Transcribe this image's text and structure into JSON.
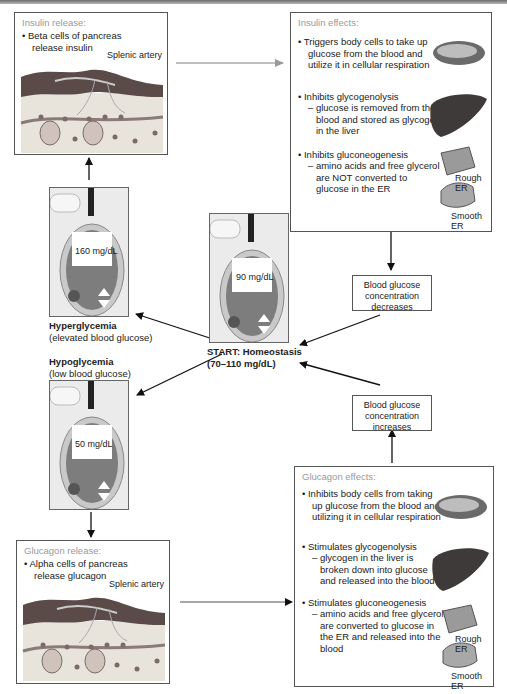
{
  "insulin_release": {
    "title": "Insulin release:",
    "bullet": "• Beta cells of pancreas",
    "bullet_cont": "release insulin",
    "artery_label": "Splenic artery"
  },
  "insulin_effects": {
    "title": "Insulin effects:",
    "items": [
      {
        "lines": [
          "• Triggers body cells to take up",
          "glucose from the blood and",
          "utilize it in cellular respiration"
        ]
      },
      {
        "lines": [
          "• Inhibits glycogenolysis",
          "– glucose is removed from the",
          "blood and stored as glycogen",
          "in the liver"
        ]
      },
      {
        "lines": [
          "• Inhibits gluconeogenesis",
          "– amino acids and free glycerol",
          "are NOT converted to",
          "glucose in the ER"
        ]
      }
    ],
    "rough_er": "Rough ER",
    "smooth_er": "Smooth ER"
  },
  "meters": {
    "high": "160 mg/dL",
    "normal": "90 mg/dL",
    "low": "50 mg/dL",
    "ok_label": "OK"
  },
  "states": {
    "hyper_title": "Hyperglycemia",
    "hyper_sub": "(elevated blood glucose)",
    "hypo_title": "Hypoglycemia",
    "hypo_sub": "(low blood glucose)",
    "start_title": "START: Homeostasis",
    "start_sub": "(70–110 mg/dL)"
  },
  "boxes": {
    "decreases": [
      "Blood glucose",
      "concentration",
      "decreases"
    ],
    "increases": [
      "Blood glucose",
      "concentration",
      "increases"
    ]
  },
  "glucagon_release": {
    "title": "Glucagon release:",
    "bullet": "• Alpha cells of pancreas",
    "bullet_cont": "release glucagon",
    "artery_label": "Splenic artery"
  },
  "glucagon_effects": {
    "title": "Glucagon effects:",
    "items": [
      {
        "lines": [
          "• Inhibits body cells from taking",
          "up glucose from the blood and",
          "utilizing it in cellular respiration"
        ]
      },
      {
        "lines": [
          "• Stimulates glycogenolysis",
          "– glycogen in the liver is",
          "broken down into glucose",
          "and released into the blood"
        ]
      },
      {
        "lines": [
          "• Stimulates gluconeogenesis",
          "– amino acids and free glycerol",
          "are converted to glucose in",
          "the ER and released into the",
          "blood"
        ]
      }
    ],
    "rough_er": "Rough ER",
    "smooth_er": "Smooth ER"
  },
  "colors": {
    "panel_border": "#555555",
    "title_gray": "#999999",
    "artery": "#5a4a48",
    "tissue": "#e8e4dc",
    "meter_body": "#8a8a8a",
    "screen": "#ffffff"
  }
}
